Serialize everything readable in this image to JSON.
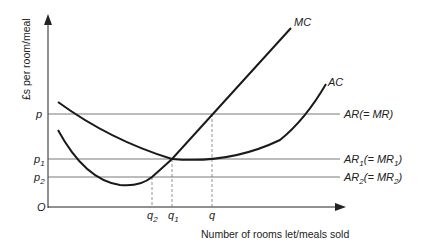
{
  "diagram": {
    "y_axis_label": "£s per room/meal",
    "x_axis_label": "Number of rooms let/meals sold",
    "origin_label": "O",
    "price_levels": [
      {
        "id": "p",
        "label": "p",
        "sub": "",
        "line_label": "AR(= MR)"
      },
      {
        "id": "p1",
        "label": "p",
        "sub": "1",
        "line_label_parts": [
          "AR",
          "1",
          "(= MR",
          "1",
          ")"
        ]
      },
      {
        "id": "p2",
        "label": "p",
        "sub": "2",
        "line_label_parts": [
          "AR",
          "2",
          "(= MR",
          "2",
          ")"
        ]
      }
    ],
    "quantities": [
      {
        "id": "q2",
        "label": "q",
        "sub": "2"
      },
      {
        "id": "q1",
        "label": "q",
        "sub": "1"
      },
      {
        "id": "q",
        "label": "q",
        "sub": ""
      }
    ],
    "curves": [
      {
        "id": "mc",
        "label": "MC"
      },
      {
        "id": "ac",
        "label": "AC"
      }
    ],
    "colors": {
      "line": "#1a1a1a",
      "guide": "#555555",
      "dashed": "#777777"
    }
  }
}
